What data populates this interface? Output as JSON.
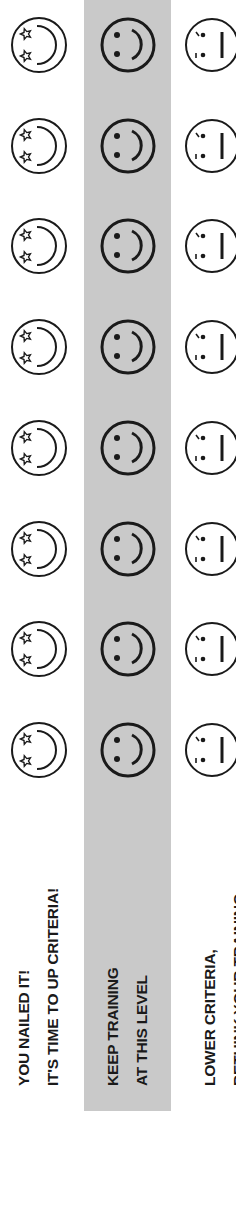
{
  "layout": "rotated-90-ccw",
  "colors": {
    "band": "#c9c9c9",
    "ink": "#1a1a1a",
    "background": "#ffffff"
  },
  "rows": [
    {
      "id": "up-criteria",
      "label_lines": [
        "YOU NAILED IT!",
        "IT'S TIME TO UP CRITERIA!"
      ],
      "icon": "star-eyes-face-icon",
      "icon_count": 8,
      "highlighted": false
    },
    {
      "id": "keep-training",
      "label_lines": [
        "KEEP TRAINING",
        "AT THIS LEVEL"
      ],
      "icon": "smiley-face-icon",
      "icon_count": 8,
      "highlighted": true
    },
    {
      "id": "lower-criteria",
      "label_lines": [
        "LOWER CRITERIA,",
        "RETHINK YOUR TRAINING"
      ],
      "icon": "meh-face-icon",
      "icon_count": 8,
      "highlighted": false
    }
  ]
}
